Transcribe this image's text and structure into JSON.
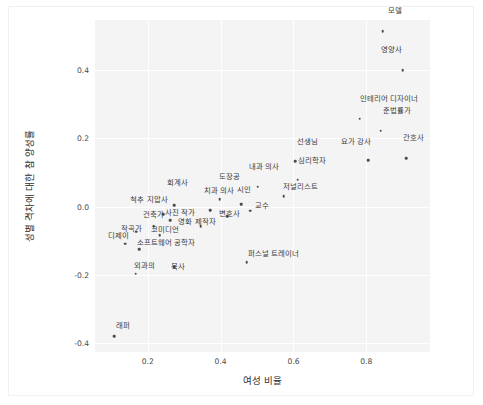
{
  "chart_data": {
    "type": "scatter",
    "title": "",
    "xlabel": "여성 비율",
    "ylabel": "성별 격차에 대한 참 양성률",
    "xlim": [
      0.055,
      0.975
    ],
    "ylim": [
      -0.425,
      0.545
    ],
    "xticks": [
      0.2,
      0.4,
      0.6,
      0.8
    ],
    "xtick_labels": [
      "0.2",
      "0.4",
      "0.6",
      "0.8"
    ],
    "yticks": [
      0.4,
      0.2,
      0.0,
      -0.2,
      -0.4
    ],
    "ytick_labels": [
      "0.4",
      "0.2",
      "0.0",
      "-0.2",
      "-0.4"
    ],
    "grid": true,
    "grid_color": "#ffffff",
    "plot_bg": "#f4f4f4",
    "marker_color": "#4c4c4c",
    "legend": null,
    "points": [
      {
        "label": "모델",
        "x": 0.845,
        "y": 0.512,
        "lx": 0.878,
        "ly": 0.56
      },
      {
        "label": "영양사",
        "x": 0.9,
        "y": 0.398,
        "lx": 0.868,
        "ly": 0.447
      },
      {
        "label": "인테리어 디자이너",
        "x": 0.782,
        "y": 0.257,
        "lx": 0.862,
        "ly": 0.303
      },
      {
        "label": "준법률가",
        "x": 0.84,
        "y": 0.222,
        "lx": 0.884,
        "ly": 0.268
      },
      {
        "label": "간호사",
        "x": 0.91,
        "y": 0.142,
        "lx": 0.93,
        "ly": 0.19
      },
      {
        "label": "요가 강사",
        "x": 0.805,
        "y": 0.136,
        "lx": 0.772,
        "ly": 0.178
      },
      {
        "label": "선생님",
        "x": 0.605,
        "y": 0.132,
        "lx": 0.638,
        "ly": 0.178
      },
      {
        "label": "심리학자",
        "x": 0.612,
        "y": 0.078,
        "lx": 0.65,
        "ly": 0.122
      },
      {
        "label": "내과 의사",
        "x": 0.502,
        "y": 0.058,
        "lx": 0.52,
        "ly": 0.103
      },
      {
        "label": "저널리스트",
        "x": 0.573,
        "y": 0.03,
        "lx": 0.62,
        "ly": 0.046
      },
      {
        "label": "도장공",
        "x": 0.398,
        "y": 0.022,
        "lx": 0.425,
        "ly": 0.075
      },
      {
        "label": "회계사",
        "x": 0.272,
        "y": 0.004,
        "lx": 0.282,
        "ly": 0.058
      },
      {
        "label": "치과 의사",
        "x": 0.372,
        "y": -0.01,
        "lx": 0.395,
        "ly": 0.033
      },
      {
        "label": "시인",
        "x": 0.456,
        "y": 0.006,
        "lx": 0.463,
        "ly": 0.036
      },
      {
        "label": "교수",
        "x": 0.482,
        "y": -0.012,
        "lx": 0.513,
        "ly": -0.01
      },
      {
        "label": "척추 지압사",
        "x": 0.243,
        "y": -0.022,
        "lx": 0.203,
        "ly": 0.006
      },
      {
        "label": "변호사",
        "x": 0.418,
        "y": -0.028,
        "lx": 0.424,
        "ly": -0.034
      },
      {
        "label": "사진 작가",
        "x": 0.262,
        "y": -0.04,
        "lx": 0.288,
        "ly": -0.03
      },
      {
        "label": "건축가",
        "x": 0.216,
        "y": -0.058,
        "lx": 0.215,
        "ly": -0.036
      },
      {
        "label": "영화 제작자",
        "x": 0.345,
        "y": -0.058,
        "lx": 0.335,
        "ly": -0.056
      },
      {
        "label": "코미디언",
        "x": 0.233,
        "y": -0.084,
        "lx": 0.247,
        "ly": -0.08
      },
      {
        "label": "작곡가",
        "x": 0.168,
        "y": -0.074,
        "lx": 0.155,
        "ly": -0.076
      },
      {
        "label": "디제이",
        "x": 0.138,
        "y": -0.108,
        "lx": 0.12,
        "ly": -0.098
      },
      {
        "label": "소프트웨어 공학자",
        "x": 0.176,
        "y": -0.125,
        "lx": 0.25,
        "ly": -0.118
      },
      {
        "label": "퍼스널 트레이너",
        "x": 0.472,
        "y": -0.162,
        "lx": 0.545,
        "ly": -0.15
      },
      {
        "label": "외과의",
        "x": 0.167,
        "y": -0.196,
        "lx": 0.19,
        "ly": -0.185
      },
      {
        "label": "목사",
        "x": 0.272,
        "y": -0.178,
        "lx": 0.282,
        "ly": -0.188
      },
      {
        "label": "래퍼",
        "x": 0.108,
        "y": -0.378,
        "lx": 0.132,
        "ly": -0.362
      }
    ]
  }
}
